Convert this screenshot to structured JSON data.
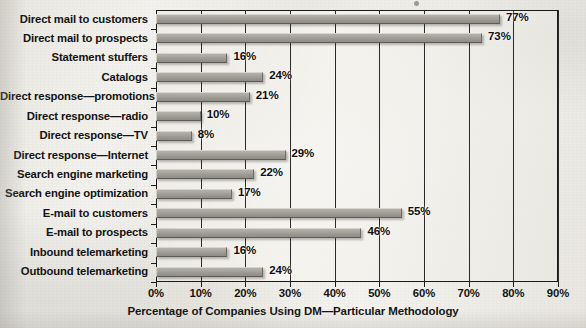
{
  "chart_data": {
    "type": "bar",
    "orientation": "horizontal",
    "title": "",
    "xlabel": "Percentage of Companies Using DM—Particular Methodology",
    "ylabel": "",
    "xlim": [
      0,
      90
    ],
    "grid": true,
    "legend": "none",
    "xticks": [
      "0%",
      "10%",
      "20%",
      "30%",
      "40%",
      "50%",
      "60%",
      "70%",
      "80%",
      "90%"
    ],
    "xtick_values": [
      0,
      10,
      20,
      30,
      40,
      50,
      60,
      70,
      80,
      90
    ],
    "categories": [
      "Direct mail to customers",
      "Direct mail to prospects",
      "Statement stuffers",
      "Catalogs",
      "Direct response—promotions",
      "Direct response—radio",
      "Direct response—TV",
      "Direct response—Internet",
      "Search engine marketing",
      "Search engine optimization",
      "E-mail to customers",
      "E-mail to prospects",
      "Inbound telemarketing",
      "Outbound telemarketing"
    ],
    "values": [
      77,
      73,
      16,
      24,
      21,
      10,
      8,
      29,
      22,
      17,
      55,
      46,
      16,
      24
    ],
    "data_labels": [
      "77%",
      "73%",
      "16%",
      "24%",
      "21%",
      "10%",
      "8%",
      "29%",
      "22%",
      "17%",
      "55%",
      "46%",
      "16%",
      "24%"
    ],
    "bar_color": "#a6a49d",
    "axis_color": "#1c1c1c",
    "background_color": "#efeee9"
  }
}
